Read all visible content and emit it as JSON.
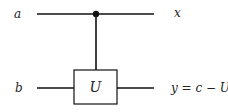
{
  "diagram": {
    "type": "quantum-circuit",
    "inputs": [
      {
        "label": "a",
        "wire": "top"
      },
      {
        "label": "b",
        "wire": "bottom"
      }
    ],
    "outputs": [
      {
        "label": "x",
        "wire": "top"
      },
      {
        "label": "y = c − U",
        "wire": "bottom"
      }
    ],
    "gate": {
      "label": "U",
      "controlled_by": "top"
    },
    "colors": {
      "line": "#111111",
      "background": "#ffffff"
    }
  }
}
